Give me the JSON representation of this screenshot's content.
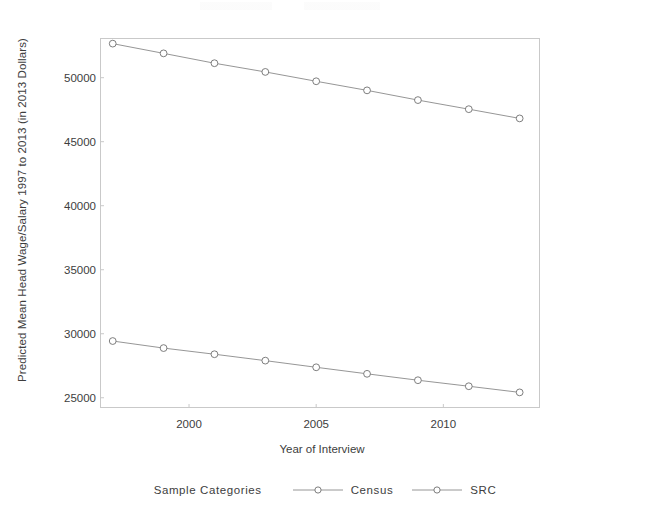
{
  "chart_data": {
    "type": "line",
    "title": "",
    "xlabel": "Year of Interview",
    "ylabel": "Predicted Mean Head Wage/Salary 1997 to 2013 (in 2013 Dollars)",
    "x": [
      1997,
      1999,
      2001,
      2003,
      2005,
      2007,
      2009,
      2011,
      2013
    ],
    "xlim": [
      1996.5,
      2013.8
    ],
    "ylim": [
      24200,
      53100
    ],
    "xticks": [
      2000,
      2005,
      2010
    ],
    "xtick_labels": [
      "2000",
      "2005",
      "2010"
    ],
    "yticks": [
      25000,
      30000,
      35000,
      40000,
      45000,
      50000
    ],
    "ytick_labels": [
      "25000",
      "30000",
      "35000",
      "40000",
      "45000",
      "50000"
    ],
    "grid": false,
    "legend_position": "bottom",
    "legend_title": "Sample Categories",
    "marker": "open-circle",
    "series": [
      {
        "name": "Census",
        "color": "#7a7a7a",
        "values": [
          52660,
          51900,
          51130,
          50450,
          49720,
          49010,
          48250,
          47540,
          46820
        ]
      },
      {
        "name": "SRC",
        "color": "#7a7a7a",
        "values": [
          29430,
          28880,
          28400,
          27900,
          27380,
          26870,
          26370,
          25900,
          25420
        ]
      }
    ]
  },
  "legend": {
    "title": "Sample Categories",
    "entries": [
      {
        "label": "Census"
      },
      {
        "label": "SRC"
      }
    ]
  },
  "colors": {
    "axis": "#c9c9c9",
    "line": "#8a8a8a",
    "marker_stroke": "#6f6f6f",
    "marker_fill": "#ffffff",
    "text": "#3d3d3d",
    "background": "#ffffff"
  }
}
